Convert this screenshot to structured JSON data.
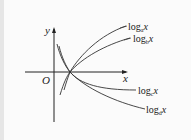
{
  "figure": {
    "type": "function-graph",
    "axes": {
      "x_label": "x",
      "y_label": "y",
      "origin_label": "O"
    },
    "curves": [
      {
        "id": "a",
        "label_prefix": "log",
        "base": "a",
        "var": "x",
        "color": "#333333"
      },
      {
        "id": "b",
        "label_prefix": "log",
        "base": "b",
        "var": "x",
        "color": "#333333"
      },
      {
        "id": "c",
        "label_prefix": "log",
        "base": "c",
        "var": "x",
        "color": "#333333"
      },
      {
        "id": "d",
        "label_prefix": "log",
        "base": "d",
        "var": "x",
        "color": "#333333"
      }
    ],
    "common_point": "(1, 0)"
  }
}
